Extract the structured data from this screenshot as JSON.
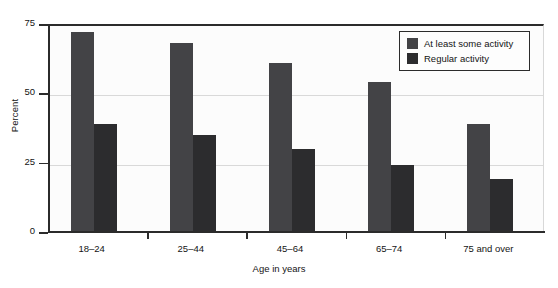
{
  "chart_data": {
    "type": "bar",
    "title": "",
    "xlabel": "Age in years",
    "ylabel": "Percent",
    "categories": [
      "18–24",
      "25–44",
      "45–64",
      "65–74",
      "75 and over"
    ],
    "series": [
      {
        "name": "At least some activity",
        "values": [
          72,
          68,
          61,
          54,
          39
        ],
        "color": "#434346"
      },
      {
        "name": "Regular activity",
        "values": [
          39,
          35,
          30,
          24,
          19
        ],
        "color": "#2c2c2e"
      }
    ],
    "ylim": [
      0,
      75
    ],
    "yticks": [
      0,
      25,
      50,
      75
    ],
    "ytick_labels": [
      "0",
      "25",
      "50",
      "75"
    ],
    "grid": "horizontal",
    "legend_position": "top-right"
  },
  "axis": {
    "y_title": "Percent",
    "x_title": "Age in years"
  },
  "legend": {
    "entries": [
      {
        "label": "At least some activity"
      },
      {
        "label": "Regular activity"
      }
    ]
  }
}
